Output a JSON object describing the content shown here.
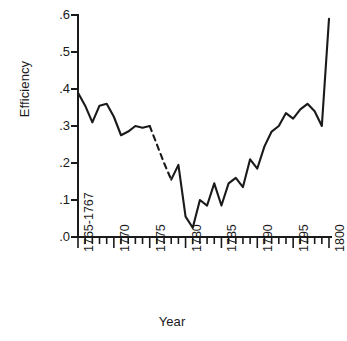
{
  "chart_data": {
    "type": "line",
    "title": "",
    "xlabel": "Year",
    "ylabel": "Efficiency",
    "xlim": [
      1765,
      1800
    ],
    "ylim": [
      0.0,
      0.6
    ],
    "grid": false,
    "legend": "none",
    "y_ticks": [
      ".0",
      ".1",
      ".2",
      ".3",
      ".4",
      ".5",
      ".6"
    ],
    "y_tick_values": [
      0.0,
      0.1,
      0.2,
      0.3,
      0.4,
      0.5,
      0.6
    ],
    "x_ticks": [
      "1765-1767",
      "1770",
      "1775",
      "1780",
      "1785",
      "1790",
      "1795",
      "1800"
    ],
    "x_tick_values": [
      1765,
      1770,
      1775,
      1780,
      1785,
      1790,
      1795,
      1800
    ],
    "minor_tick_interval": 1,
    "line_color": "#1a1a1a",
    "series": [
      {
        "name": "Efficiency",
        "style": "solid",
        "x": [
          1765,
          1766,
          1767,
          1768,
          1769,
          1770,
          1771,
          1772,
          1773,
          1774,
          1775
        ],
        "values": [
          0.39,
          0.355,
          0.31,
          0.355,
          0.36,
          0.325,
          0.275,
          0.285,
          0.3,
          0.295,
          0.3
        ]
      },
      {
        "name": "Efficiency (interpolated)",
        "style": "dashed",
        "x": [
          1775,
          1776,
          1777,
          1778
        ],
        "values": [
          0.3,
          0.25,
          0.2,
          0.155
        ]
      },
      {
        "name": "Efficiency (continued)",
        "style": "solid",
        "x": [
          1778,
          1779,
          1780,
          1781,
          1782,
          1783,
          1784,
          1785,
          1786,
          1787,
          1788,
          1789,
          1790,
          1791,
          1792,
          1793,
          1794,
          1795,
          1796,
          1797,
          1798,
          1799,
          1800
        ],
        "values": [
          0.155,
          0.195,
          0.055,
          0.025,
          0.1,
          0.085,
          0.145,
          0.085,
          0.145,
          0.16,
          0.135,
          0.21,
          0.185,
          0.245,
          0.285,
          0.3,
          0.335,
          0.32,
          0.345,
          0.36,
          0.34,
          0.3,
          0.59
        ]
      }
    ]
  }
}
